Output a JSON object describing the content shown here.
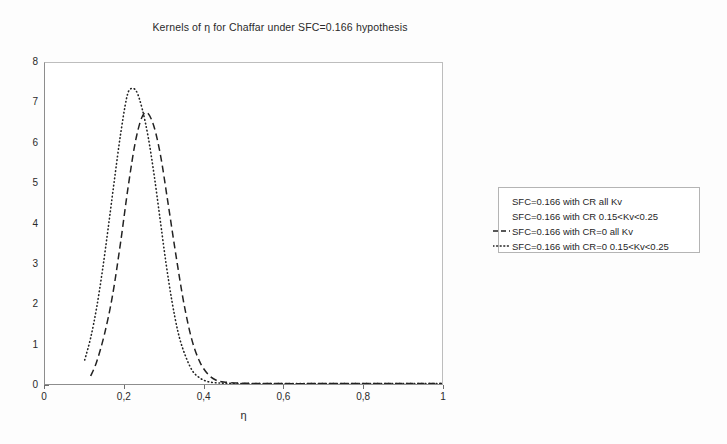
{
  "chart_data": {
    "type": "line",
    "title": "Kernels of η for Chaffar under SFC=0.166 hypothesis",
    "xlabel": "η",
    "ylabel": "",
    "xlim": [
      0,
      1
    ],
    "ylim": [
      0,
      8
    ],
    "grid": false,
    "legend_position": "right",
    "xticks": [
      0,
      0.2,
      0.4,
      0.6,
      0.8,
      1
    ],
    "xtick_labels": [
      "0",
      "0,2",
      "0,4",
      "0,6",
      "0,8",
      "1"
    ],
    "yticks": [
      0,
      1,
      2,
      3,
      4,
      5,
      6,
      7,
      8
    ],
    "ytick_labels": [
      "0",
      "1",
      "2",
      "3",
      "4",
      "5",
      "6",
      "7",
      "8"
    ],
    "series": [
      {
        "name": "SFC=0.166 with CR all Kv",
        "style": "none",
        "visible_in_plot": false,
        "x": [],
        "values": []
      },
      {
        "name": "SFC=0.166 with CR  0.15<Kv<0.25",
        "style": "none",
        "visible_in_plot": false,
        "x": [],
        "values": []
      },
      {
        "name": "SFC=0.166 with CR=0 all Kv",
        "style": "dashed",
        "visible_in_plot": true,
        "peak_x": 0.25,
        "peak_y": 6.75,
        "x": [
          0.115,
          0.13,
          0.15,
          0.17,
          0.19,
          0.21,
          0.23,
          0.25,
          0.27,
          0.29,
          0.31,
          0.33,
          0.35,
          0.37,
          0.39,
          0.41,
          0.43,
          0.45,
          0.5,
          0.6,
          0.7,
          0.8,
          0.9,
          1.0
        ],
        "values": [
          0.2,
          0.55,
          1.25,
          2.2,
          3.5,
          4.95,
          6.15,
          6.75,
          6.55,
          5.75,
          4.5,
          3.2,
          2.0,
          1.1,
          0.55,
          0.25,
          0.1,
          0.05,
          0.02,
          0.01,
          0.01,
          0.01,
          0.01,
          0.01
        ]
      },
      {
        "name": "SFC=0.166 with CR=0  0.15<Kv<0.25",
        "style": "dotted",
        "visible_in_plot": true,
        "peak_x": 0.215,
        "peak_y": 7.35,
        "x": [
          0.1,
          0.115,
          0.13,
          0.145,
          0.16,
          0.175,
          0.19,
          0.205,
          0.215,
          0.23,
          0.245,
          0.26,
          0.275,
          0.29,
          0.305,
          0.32,
          0.335,
          0.35,
          0.37,
          0.39,
          0.41,
          0.43,
          0.45,
          0.5,
          0.6,
          0.7,
          0.8,
          0.9,
          1.0
        ],
        "values": [
          0.6,
          1.15,
          1.9,
          2.85,
          3.95,
          5.1,
          6.2,
          7.1,
          7.35,
          7.3,
          6.85,
          6.15,
          5.2,
          4.1,
          3.0,
          2.05,
          1.3,
          0.8,
          0.35,
          0.15,
          0.06,
          0.03,
          0.02,
          0.01,
          0.01,
          0.01,
          0.01,
          0.01,
          0.01
        ]
      }
    ]
  },
  "legend": {
    "entries": [
      {
        "label": "SFC=0.166 with CR all Kv",
        "style": "none"
      },
      {
        "label": "SFC=0.166 with CR  0.15<Kv<0.25",
        "style": "none"
      },
      {
        "label": "SFC=0.166 with CR=0 all Kv",
        "style": "dashed"
      },
      {
        "label": "SFC=0.166 with CR=0  0.15<Kv<0.25",
        "style": "dotted"
      }
    ]
  },
  "colors": {
    "curve": "#222222",
    "axis": "#8d8d8d",
    "frame": "#bdbdbd",
    "text": "#1f1f1f",
    "background": "#fdfdfd"
  }
}
